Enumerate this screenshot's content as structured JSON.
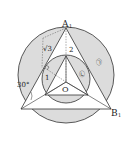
{
  "figure": {
    "labels": {
      "vertex_top": "A",
      "vertex_top_sub": "1",
      "vertex_right": "B",
      "vertex_right_sub": "1",
      "center": "O",
      "angle": "30°",
      "seg_sqrt3": "√3",
      "seg_2": "2",
      "seg_1": "1",
      "region_outer": "㉠",
      "region_inner": "㉡"
    },
    "colors": {
      "shade": "#dcdcdc",
      "line": "#333333",
      "background": "#ffffff"
    }
  }
}
